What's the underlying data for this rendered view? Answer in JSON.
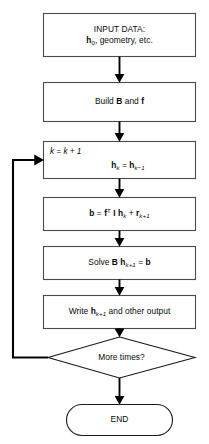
{
  "diagram": {
    "background_color": "#ffffff",
    "line_color": "#3a3a3a",
    "arrow_color": "#000000",
    "text_color": "#0a0a0a"
  },
  "nodes": {
    "input": {
      "shape": "process",
      "line1": "INPUT DATA:",
      "line2_pre": "h",
      "line2_sub": "0",
      "line2_post": ", geometry, etc."
    },
    "build": {
      "shape": "process",
      "pre": "Build ",
      "matrix": "B",
      "mid": " and ",
      "vector": "f"
    },
    "increment": {
      "shape": "process",
      "counter": "k = k + 1",
      "counter_var": "k",
      "eq_lhs": "h",
      "eq_lhs_sub": "k",
      "eq_op": " = ",
      "eq_rhs": "h",
      "eq_rhs_sub": "k−1"
    },
    "residual": {
      "shape": "process",
      "lhs": "b",
      "op1": " = ",
      "f": "f",
      "f_sup": "T",
      "identity": " I ",
      "h": "h",
      "h_sub": "k",
      "plus": " + ",
      "r": "r",
      "r_sub": "k+1"
    },
    "solve": {
      "shape": "process",
      "pre": "Solve ",
      "matrix": "B",
      "space": " ",
      "h": "h",
      "h_sub": "k+1",
      "eq": " = ",
      "b": "b"
    },
    "write": {
      "shape": "process",
      "pre": "Write ",
      "h": "h",
      "h_sub": "k+1",
      "post": " and other output"
    },
    "decision": {
      "shape": "decision",
      "label": "More times?"
    },
    "end": {
      "shape": "terminator",
      "label": "END"
    }
  },
  "edges": [
    {
      "from": "input",
      "to": "build",
      "kind": "arrow-down"
    },
    {
      "from": "build",
      "to": "increment",
      "kind": "arrow-down"
    },
    {
      "from": "increment",
      "to": "residual",
      "kind": "arrow-down"
    },
    {
      "from": "residual",
      "to": "solve",
      "kind": "arrow-down"
    },
    {
      "from": "solve",
      "to": "write",
      "kind": "arrow-down"
    },
    {
      "from": "write",
      "to": "decision",
      "kind": "arrow-down"
    },
    {
      "from": "decision",
      "to": "end",
      "kind": "arrow-down"
    },
    {
      "from": "decision",
      "to": "increment",
      "kind": "feedback-loop-left"
    }
  ]
}
